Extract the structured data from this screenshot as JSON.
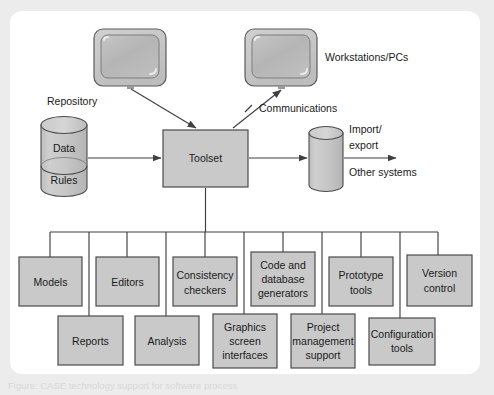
{
  "figure": {
    "colors": {
      "box_fill": "#c9c9c9",
      "box_stroke": "#4b4b4b",
      "cylinder_fill": "#c9c9c9",
      "monitor_bezel": "#c3c3c3",
      "monitor_screen": "#b9b9b9",
      "line": "#4b4b4b",
      "text": "#1a1a1a",
      "page_background": "#ffffff",
      "scan_background": "#ececed"
    },
    "labels": {
      "repository": "Repository",
      "workstations": "Workstations/PCs",
      "communications": "Communications",
      "import_export_line1": "Import/",
      "import_export_line2": "export",
      "other_systems": "Other systems"
    },
    "repository": {
      "name": "Repository",
      "sections": [
        {
          "label": "Data"
        },
        {
          "label": "Rules"
        }
      ]
    },
    "central_node": {
      "label": "Toolset"
    },
    "export_store": {
      "label": ""
    },
    "workstations": [
      {
        "name": "workstation-left"
      },
      {
        "name": "workstation-right"
      }
    ],
    "tool_rows": {
      "row1": [
        {
          "lines": [
            "Models"
          ]
        },
        {
          "lines": [
            "Editors"
          ]
        },
        {
          "lines": [
            "Consistency",
            "checkers"
          ]
        },
        {
          "lines": [
            "Code and",
            "database",
            "generators"
          ]
        },
        {
          "lines": [
            "Prototype",
            "tools"
          ]
        },
        {
          "lines": [
            "Version",
            "control"
          ]
        }
      ],
      "row2": [
        {
          "lines": [
            "Reports"
          ]
        },
        {
          "lines": [
            "Analysis"
          ]
        },
        {
          "lines": [
            "Graphics",
            "screen",
            "interfaces"
          ]
        },
        {
          "lines": [
            "Project",
            "management",
            "support"
          ]
        },
        {
          "lines": [
            "Configuration",
            "tools"
          ]
        }
      ]
    },
    "connections": [
      {
        "from": "workstation-left",
        "to": "toolset",
        "arrow": true
      },
      {
        "from": "workstation-right",
        "to": "toolset",
        "arrow": true,
        "label": "Communications"
      },
      {
        "from": "repository",
        "to": "toolset",
        "arrow": true
      },
      {
        "from": "toolset",
        "to": "export_store",
        "arrow": true
      },
      {
        "from": "export_store",
        "to": "other_systems",
        "arrow": true
      },
      {
        "from": "toolset",
        "to": "tool_bus",
        "arrow": false
      }
    ],
    "caption": "Figure: CASE technology support for software process"
  }
}
